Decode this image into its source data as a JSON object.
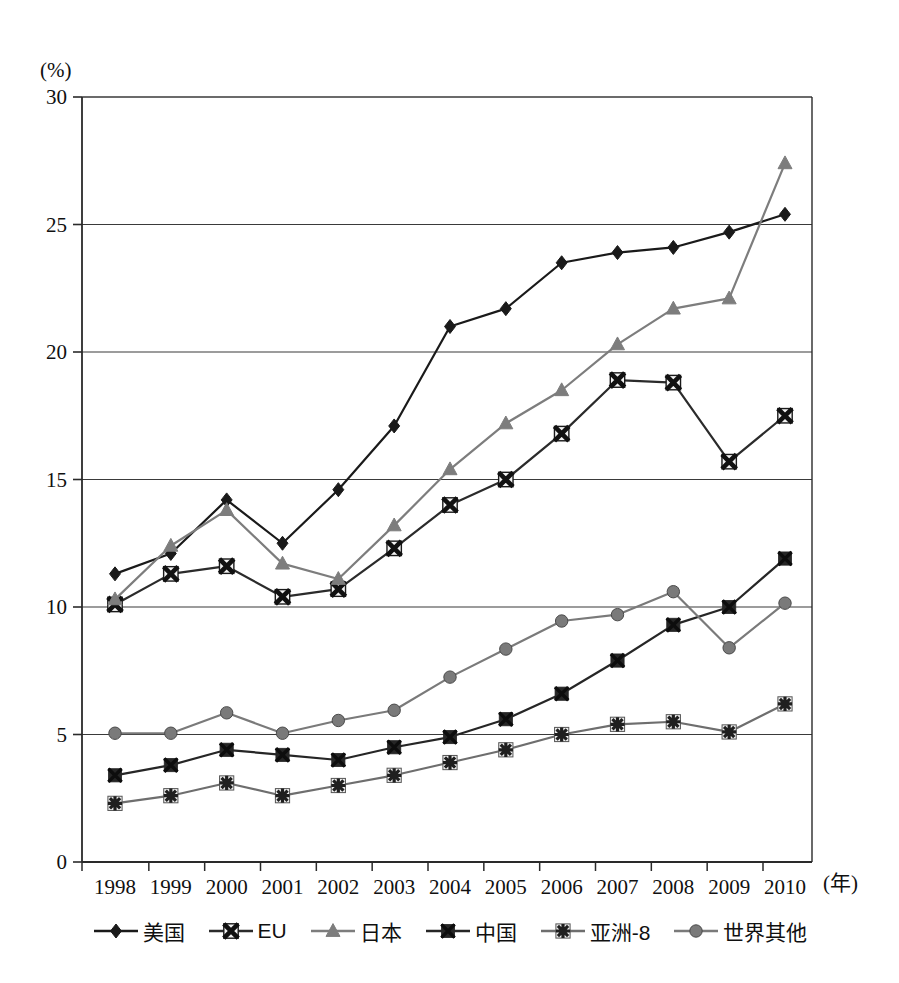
{
  "chart_data": {
    "type": "line",
    "title": "",
    "xlabel": "(年)",
    "ylabel": "(%)",
    "ylim": [
      0,
      30
    ],
    "ytick_values": [
      0,
      5,
      10,
      15,
      20,
      25,
      30
    ],
    "ytick_labels": [
      "0",
      "5",
      "10",
      "15",
      "20",
      "25",
      "30"
    ],
    "categories": [
      "1998",
      "1999",
      "2000",
      "2001",
      "2002",
      "2003",
      "2004",
      "2005",
      "2006",
      "2007",
      "2008",
      "2009",
      "2010"
    ],
    "x": [
      1998,
      1999,
      2000,
      2001,
      2002,
      2003,
      2004,
      2005,
      2006,
      2007,
      2008,
      2009,
      2010
    ],
    "grid": true,
    "legend_position": "bottom",
    "series": [
      {
        "name": "美国",
        "marker": "diamond",
        "color": "#1a1a1a",
        "values": [
          11.3,
          12.1,
          14.2,
          12.5,
          14.6,
          17.1,
          21.0,
          21.7,
          23.5,
          23.9,
          24.1,
          24.7,
          25.4
        ]
      },
      {
        "name": "EU",
        "marker": "x-square",
        "color": "#2b2b2b",
        "values": [
          10.1,
          11.3,
          11.6,
          10.4,
          10.7,
          12.3,
          14.0,
          15.0,
          16.8,
          18.9,
          18.8,
          15.7,
          17.5
        ]
      },
      {
        "name": "日本",
        "marker": "triangle",
        "color": "#7d7d7d",
        "values": [
          10.3,
          12.4,
          13.8,
          11.7,
          11.1,
          13.2,
          15.4,
          17.2,
          18.5,
          20.3,
          21.7,
          22.1,
          27.4
        ]
      },
      {
        "name": "中国",
        "marker": "x",
        "color": "#262626",
        "values": [
          3.4,
          3.8,
          4.4,
          4.2,
          4.0,
          4.5,
          4.9,
          5.6,
          6.6,
          7.9,
          9.3,
          10.0,
          11.9
        ]
      },
      {
        "name": "亚洲-8",
        "marker": "asterisk",
        "color": "#6e6e6e",
        "values": [
          2.3,
          2.6,
          3.1,
          2.6,
          3.0,
          3.4,
          3.9,
          4.4,
          5.0,
          5.4,
          5.5,
          5.1,
          6.2
        ]
      },
      {
        "name": "世界其他",
        "marker": "circle",
        "color": "#7a7a7a",
        "values": [
          5.05,
          5.05,
          5.85,
          5.05,
          5.55,
          5.95,
          7.25,
          8.35,
          9.45,
          9.7,
          10.6,
          8.4,
          10.15
        ]
      }
    ]
  },
  "legend": {
    "items": [
      {
        "label": "美国",
        "marker": "diamond",
        "color": "#1a1a1a"
      },
      {
        "label": "EU",
        "marker": "x-square",
        "color": "#2b2b2b"
      },
      {
        "label": "日本",
        "marker": "triangle",
        "color": "#7d7d7d"
      },
      {
        "label": "中国",
        "marker": "x",
        "color": "#262626"
      },
      {
        "label": "亚洲-8",
        "marker": "asterisk",
        "color": "#6e6e6e"
      },
      {
        "label": "世界其他",
        "marker": "circle",
        "color": "#7a7a7a"
      }
    ]
  },
  "axes": {
    "y_unit": "(%)",
    "x_unit": "(年)"
  }
}
